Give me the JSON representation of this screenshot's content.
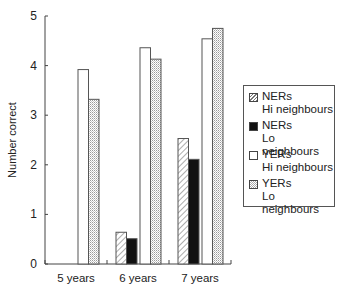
{
  "chart_data": {
    "type": "bar",
    "title": "",
    "xlabel": "",
    "ylabel": "Number correct",
    "ylim": [
      0,
      5
    ],
    "yticks": [
      0,
      1,
      2,
      3,
      4,
      5
    ],
    "grid": false,
    "legend_position": "right",
    "categories": [
      "5 years",
      "6 years",
      "7 years"
    ],
    "series": [
      {
        "name": "NERs Hi neighbours",
        "label_line1": "NERs",
        "label_line2": "Hi neighbours",
        "pattern": "hatched",
        "values": [
          0,
          0.64,
          2.53
        ]
      },
      {
        "name": "NERs Lo neighbours",
        "label_line1": "NERs",
        "label_line2": "Lo neighbours",
        "pattern": "solid-black",
        "values": [
          0,
          0.51,
          2.11
        ]
      },
      {
        "name": "YERs Hi neighbours",
        "label_line1": "YERs",
        "label_line2": "Hi neighbours",
        "pattern": "white",
        "values": [
          3.92,
          4.36,
          4.54
        ]
      },
      {
        "name": "YERs Lo neighbours",
        "label_line1": "YERs",
        "label_line2": "Lo neighbours",
        "pattern": "dotted",
        "values": [
          3.32,
          4.13,
          4.75
        ]
      }
    ]
  },
  "colors": {
    "axis": "#444444",
    "black_fill": "#111111",
    "bar_outline": "#555555",
    "dot": "#9a9a9a",
    "hatch": "#777777"
  }
}
